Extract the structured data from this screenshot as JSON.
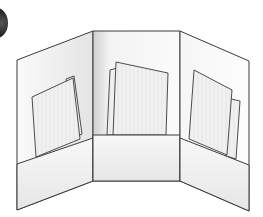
{
  "illustration": {
    "subject": "tri-fold presentation folder with three pockets holding papers",
    "step_badge": "",
    "panels": [
      {
        "name": "left",
        "has_pocket": true,
        "papers": 2
      },
      {
        "name": "center",
        "has_pocket": true,
        "papers": 2
      },
      {
        "name": "right",
        "has_pocket": true,
        "papers": 2
      }
    ],
    "colors": {
      "outline": "#3a3a3a",
      "panel_fill": "#f7f7f7",
      "pocket_fill": "#efefef",
      "paper_fill": "#f2f2f2",
      "shadow": "#c8c8c8"
    }
  }
}
